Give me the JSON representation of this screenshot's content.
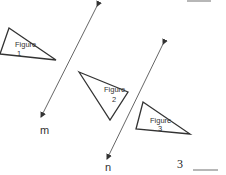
{
  "diagram": {
    "lines": [
      {
        "label": "m",
        "x1": 97,
        "y1": 6,
        "x2": 41,
        "y2": 117,
        "label_x": 40,
        "label_y": 134
      },
      {
        "label": "n",
        "x1": 163,
        "y1": 44,
        "x2": 107,
        "y2": 159,
        "label_x": 105,
        "label_y": 171
      }
    ],
    "figures": [
      {
        "name": "Figure",
        "number": "1",
        "points": "9,28 56,60 0,54",
        "text_x": 15,
        "text_y": 47,
        "num_x": 17,
        "num_y": 56
      },
      {
        "name": "Figure",
        "number": "2",
        "points": "79,72 128,92 110,120",
        "text_x": 104,
        "text_y": 92,
        "num_x": 112,
        "num_y": 102
      },
      {
        "name": "Figure",
        "number": "3",
        "points": "143,102 190,134 136,129",
        "text_x": 150,
        "text_y": 123,
        "num_x": 158,
        "num_y": 131
      }
    ],
    "answer_blanks": [
      {
        "number": "",
        "x1": 187,
        "y1": 1,
        "x2": 211,
        "y2": 1
      },
      {
        "number": "3",
        "x1": 193,
        "y1": 170,
        "x2": 218,
        "y2": 170,
        "num_x": 177,
        "num_y": 168
      }
    ],
    "stroke_color": "#333333"
  }
}
